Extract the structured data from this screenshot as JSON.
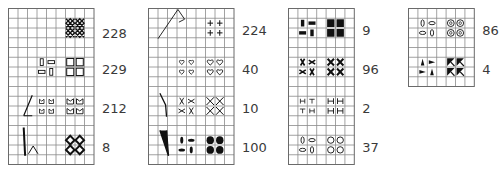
{
  "colors": {
    "grid": "#8a8a8a",
    "ink": "#111111",
    "label": "#3a3a3a"
  },
  "charts": [
    {
      "id": "chart-1",
      "x": 8.5,
      "y": 8.5,
      "cols": 9,
      "rows": 16,
      "cw": 9.5,
      "ch": 9.75,
      "entries": [
        {
          "label": "228",
          "label_row": 2,
          "symbol": "cross-hatch",
          "motif": "none",
          "row": 1
        },
        {
          "label": "229",
          "label_row": 5.7,
          "symbol": "open-bar",
          "motif": "none",
          "row": 5
        },
        {
          "label": "212",
          "label_row": 9.7,
          "symbol": "crown",
          "motif": "angle-line",
          "row": 9
        },
        {
          "label": "8",
          "label_row": 13.7,
          "symbol": "diamond-ring",
          "motif": "bar-bracket",
          "row": 13
        }
      ]
    },
    {
      "id": "chart-2",
      "x": 148.5,
      "y": 8.5,
      "cols": 9,
      "rows": 16,
      "cw": 9.5,
      "ch": 9.75,
      "entries": [
        {
          "label": "224",
          "label_row": 1.7,
          "symbol": "plus",
          "motif": "diagonal-flag",
          "row": 1
        },
        {
          "label": "40",
          "label_row": 5.7,
          "symbol": "heart",
          "motif": "none",
          "row": 5
        },
        {
          "label": "10",
          "label_row": 9.7,
          "symbol": "x-cross",
          "motif": "slash-line",
          "row": 9
        },
        {
          "label": "100",
          "label_row": 13.7,
          "symbol": "filled-dot",
          "motif": "v-wedge",
          "row": 13
        }
      ]
    },
    {
      "id": "chart-3",
      "x": 288.5,
      "y": 8.5,
      "cols": 7,
      "rows": 16,
      "cw": 9.4,
      "ch": 9.75,
      "entries": [
        {
          "label": "9",
          "label_row": 1.7,
          "symbol": "filled-square",
          "motif": "none",
          "row": 1
        },
        {
          "label": "96",
          "label_row": 5.7,
          "symbol": "bow-x",
          "motif": "none",
          "row": 5
        },
        {
          "label": "2",
          "label_row": 9.7,
          "symbol": "h-bar",
          "motif": "none",
          "row": 9
        },
        {
          "label": "37",
          "label_row": 13.7,
          "symbol": "open-ring",
          "motif": "none",
          "row": 13
        }
      ]
    },
    {
      "id": "chart-4",
      "x": 408.5,
      "y": 8.5,
      "cols": 7,
      "rows": 8,
      "cw": 9.4,
      "ch": 9.75,
      "entries": [
        {
          "label": "86",
          "label_row": 1.7,
          "symbol": "double-ring",
          "motif": "none",
          "row": 1
        },
        {
          "label": "4",
          "label_row": 5.7,
          "symbol": "arrow-tri",
          "motif": "none",
          "row": 5
        }
      ]
    }
  ]
}
